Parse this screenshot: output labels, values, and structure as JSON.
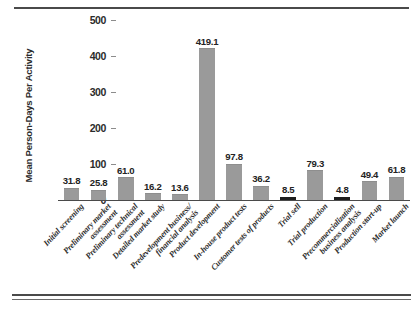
{
  "chart_data": {
    "type": "bar",
    "title": "",
    "xlabel": "",
    "ylabel": "Mean Person-Days Per Activity",
    "ylim": [
      0,
      500
    ],
    "yticks": [
      0,
      100,
      200,
      300,
      400,
      500
    ],
    "grid": false,
    "legend": "none",
    "bar_color": "#9a9a9a",
    "label_rotation": -47,
    "categories": [
      "Initial screening",
      "Preliminary market assessment",
      "Preliminary technical assessment",
      "Detailed market study",
      "Predevelopment business/financial analysis",
      "Product development",
      "In-house product tests",
      "Customer tests of products",
      "Trial sell",
      "Trial production",
      "Precommercialization business analysis",
      "Production start-up",
      "Market launch"
    ],
    "category_lines": [
      [
        "Initial screening"
      ],
      [
        "Preliminary market",
        "assessment"
      ],
      [
        "Preliminary technical",
        "assessment"
      ],
      [
        "Detailed market study"
      ],
      [
        "Predevelopment business/",
        "financial analysis"
      ],
      [
        "Product development"
      ],
      [
        "In-house product tests"
      ],
      [
        "Customer tests of products"
      ],
      [
        "Trial sell"
      ],
      [
        "Trial production"
      ],
      [
        "Precommercialization",
        "business analysis"
      ],
      [
        "Production start-up"
      ],
      [
        "Market launch"
      ]
    ],
    "values": [
      31.8,
      25.8,
      61.0,
      16.2,
      13.6,
      419.1,
      97.8,
      36.2,
      8.5,
      79.3,
      4.8,
      49.4,
      61.8
    ],
    "value_labels": [
      "31.8",
      "25.8",
      "61.0",
      "16.2",
      "13.6",
      "419.1",
      "97.8",
      "36.2",
      "8.5",
      "79.3",
      "4.8",
      "49.4",
      "61.8"
    ]
  }
}
